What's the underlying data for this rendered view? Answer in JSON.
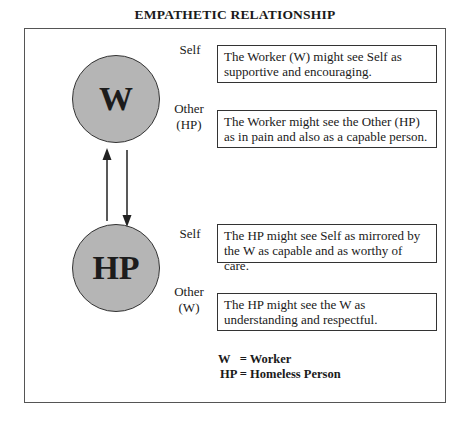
{
  "title": "EMPATHETIC RELATIONSHIP",
  "nodes": {
    "worker": {
      "symbol": "W"
    },
    "homeless_person": {
      "symbol": "HP"
    }
  },
  "sections": [
    {
      "node": "W",
      "rows": [
        {
          "label": "Self",
          "text": "The Worker (W)  might see Self as supportive and encouraging."
        },
        {
          "label": "Other (HP)",
          "label_line1": "Other",
          "label_line2": "(HP)",
          "text": "The Worker might see the Other (HP) as in pain and also as a capable person."
        }
      ]
    },
    {
      "node": "HP",
      "rows": [
        {
          "label": "Self",
          "text": "The HP might see Self as mirrored by the W as capable and as worthy of care."
        },
        {
          "label": "Other (W)",
          "label_line1": "Other",
          "label_line2": "(W)",
          "text": "The HP might see the W as understanding and respectful."
        }
      ]
    }
  ],
  "arrows": [
    {
      "from": "HP",
      "to": "W",
      "direction": "up"
    },
    {
      "from": "W",
      "to": "HP",
      "direction": "down"
    }
  ],
  "legend": {
    "line1": "W   = Worker",
    "line2": "HP = Homeless Person"
  },
  "colors": {
    "circle_fill": "#b5b5b5",
    "stroke": "#333333"
  }
}
